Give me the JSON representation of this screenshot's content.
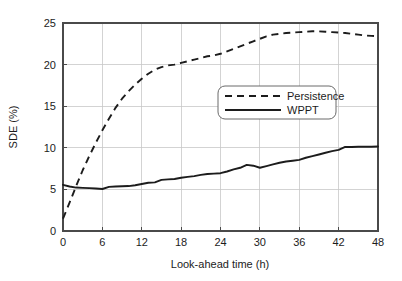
{
  "chart_data": {
    "type": "line",
    "title": "",
    "xlabel": "Look-ahead time (h)",
    "ylabel": "SDE (%)",
    "xlim": [
      0,
      48
    ],
    "ylim": [
      0,
      25
    ],
    "xticks": [
      0,
      6,
      12,
      18,
      24,
      30,
      36,
      42,
      48
    ],
    "xtick_labels": [
      "0",
      "6",
      "12",
      "18",
      "24",
      "30",
      "36",
      "42",
      "48"
    ],
    "yticks": [
      0,
      5,
      10,
      15,
      20,
      25
    ],
    "ytick_labels": [
      "0",
      "5",
      "10",
      "15",
      "20",
      "25"
    ],
    "grid": true,
    "legend_position": "center",
    "x": [
      0,
      1,
      2,
      3,
      4,
      5,
      6,
      7,
      8,
      9,
      10,
      11,
      12,
      13,
      14,
      15,
      16,
      17,
      18,
      19,
      20,
      21,
      22,
      23,
      24,
      25,
      26,
      27,
      28,
      29,
      30,
      31,
      32,
      33,
      34,
      35,
      36,
      37,
      38,
      39,
      40,
      41,
      42,
      43,
      44,
      45,
      46,
      47,
      48
    ],
    "series": [
      {
        "name": "Persistence",
        "style": "dashed",
        "color": "#1c1c1c",
        "values": [
          1.5,
          3.4,
          5.4,
          7.3,
          9.0,
          10.6,
          12.1,
          13.5,
          14.8,
          15.9,
          16.8,
          17.6,
          18.3,
          18.9,
          19.4,
          19.7,
          19.9,
          20.0,
          20.2,
          20.4,
          20.6,
          20.8,
          21.0,
          21.1,
          21.3,
          21.6,
          21.9,
          22.2,
          22.5,
          22.8,
          23.1,
          23.4,
          23.6,
          23.7,
          23.8,
          23.85,
          23.9,
          23.95,
          24.0,
          24.0,
          23.95,
          23.9,
          23.85,
          23.8,
          23.7,
          23.6,
          23.5,
          23.45,
          23.4
        ]
      },
      {
        "name": "WPPT",
        "style": "solid",
        "color": "#1c1c1c",
        "values": [
          5.55,
          5.35,
          5.22,
          5.18,
          5.15,
          5.1,
          5.05,
          5.3,
          5.35,
          5.38,
          5.4,
          5.5,
          5.65,
          5.8,
          5.85,
          6.15,
          6.2,
          6.25,
          6.4,
          6.5,
          6.6,
          6.75,
          6.85,
          6.9,
          6.95,
          7.15,
          7.4,
          7.6,
          7.95,
          7.85,
          7.6,
          7.8,
          8.0,
          8.2,
          8.35,
          8.45,
          8.55,
          8.8,
          9.0,
          9.2,
          9.4,
          9.6,
          9.75,
          10.1,
          10.1,
          10.12,
          10.12,
          10.13,
          10.15
        ]
      }
    ],
    "legend": [
      {
        "label": "Persistence",
        "style": "dashed"
      },
      {
        "label": "WPPT",
        "style": "solid"
      }
    ]
  }
}
